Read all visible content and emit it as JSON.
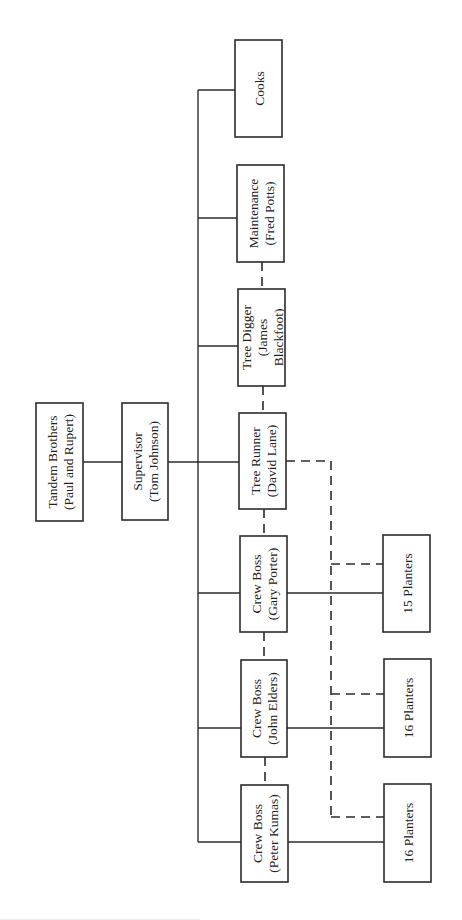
{
  "diagram": {
    "type": "org-chart",
    "orientation": "rotated-90-ccw",
    "line_color": "#2b2b2b",
    "nodes": [
      {
        "id": "tandem",
        "label_lines": [
          "Tandem Brothers",
          "(Paul and Rupert)"
        ],
        "x": 36,
        "y": 403,
        "w": 47,
        "h": 118
      },
      {
        "id": "supervisor",
        "label_lines": [
          "Supervisor",
          "(Tom Johnson)"
        ],
        "x": 122,
        "y": 403,
        "w": 46,
        "h": 117
      },
      {
        "id": "cooks",
        "label_lines": [
          "Cooks"
        ],
        "x": 235,
        "y": 40,
        "w": 47,
        "h": 97
      },
      {
        "id": "maintenance",
        "label_lines": [
          "Maintenance",
          "(Fred Potts)"
        ],
        "x": 237,
        "y": 165,
        "w": 47,
        "h": 97
      },
      {
        "id": "tree-digger",
        "label_lines": [
          "Tree Digger",
          "(James",
          "Blackfoot)"
        ],
        "x": 238,
        "y": 289,
        "w": 47,
        "h": 97
      },
      {
        "id": "tree-runner",
        "label_lines": [
          "Tree Runner",
          "(David Lane)"
        ],
        "x": 239,
        "y": 413,
        "w": 47,
        "h": 96
      },
      {
        "id": "crew-boss-gary",
        "label_lines": [
          "Crew Boss",
          "(Gary Porter)"
        ],
        "x": 240,
        "y": 536,
        "w": 47,
        "h": 96
      },
      {
        "id": "crew-boss-john",
        "label_lines": [
          "Crew Boss",
          "(John Elders)"
        ],
        "x": 241,
        "y": 660,
        "w": 46,
        "h": 97
      },
      {
        "id": "crew-boss-peter",
        "label_lines": [
          "Crew Boss",
          "(Peter Kumas)"
        ],
        "x": 241,
        "y": 785,
        "w": 47,
        "h": 97
      },
      {
        "id": "planters-15",
        "label_lines": [
          "15 Planters"
        ],
        "x": 383,
        "y": 535,
        "w": 47,
        "h": 97
      },
      {
        "id": "planters-16-a",
        "label_lines": [
          "16 Planters"
        ],
        "x": 384,
        "y": 659,
        "w": 47,
        "h": 98
      },
      {
        "id": "planters-16-b",
        "label_lines": [
          "16 Planters"
        ],
        "x": 384,
        "y": 784,
        "w": 47,
        "h": 98
      }
    ],
    "solid_lines": [
      {
        "from": "tandem",
        "to": "supervisor",
        "points": [
          [
            83,
            462
          ],
          [
            122,
            462
          ]
        ]
      },
      {
        "from": "supervisor",
        "to": "tree-runner",
        "points": [
          [
            168,
            462
          ],
          [
            239,
            462
          ]
        ]
      },
      {
        "name": "trunk",
        "points": [
          [
            198,
            90
          ],
          [
            198,
            842
          ]
        ]
      },
      {
        "to": "cooks",
        "points": [
          [
            198,
            90
          ],
          [
            235,
            90
          ]
        ]
      },
      {
        "to": "maintenance",
        "points": [
          [
            198,
            218
          ],
          [
            237,
            218
          ]
        ]
      },
      {
        "to": "tree-digger",
        "points": [
          [
            198,
            346
          ],
          [
            238,
            346
          ]
        ]
      },
      {
        "to": "crew-boss-gary",
        "points": [
          [
            198,
            593
          ],
          [
            240,
            593
          ]
        ]
      },
      {
        "to": "crew-boss-john",
        "points": [
          [
            198,
            728
          ],
          [
            241,
            728
          ]
        ]
      },
      {
        "to": "crew-boss-peter",
        "points": [
          [
            198,
            842
          ],
          [
            241,
            842
          ]
        ]
      },
      {
        "from": "crew-boss-gary",
        "to": "planters-15",
        "points": [
          [
            287,
            593
          ],
          [
            383,
            593
          ]
        ]
      },
      {
        "from": "crew-boss-john",
        "to": "planters-16-a",
        "points": [
          [
            287,
            728
          ],
          [
            384,
            728
          ]
        ]
      },
      {
        "from": "crew-boss-peter",
        "to": "planters-16-b",
        "points": [
          [
            288,
            842
          ],
          [
            384,
            842
          ]
        ]
      }
    ],
    "dashed_lines": [
      {
        "from": "maintenance",
        "to": "tree-digger",
        "points": [
          [
            262,
            262
          ],
          [
            262,
            289
          ]
        ]
      },
      {
        "from": "tree-digger",
        "to": "tree-runner",
        "points": [
          [
            263,
            386
          ],
          [
            263,
            413
          ]
        ]
      },
      {
        "from": "tree-runner",
        "to": "crew-boss-gary",
        "points": [
          [
            264,
            509
          ],
          [
            264,
            536
          ]
        ]
      },
      {
        "from": "crew-boss-gary",
        "to": "crew-boss-john",
        "points": [
          [
            264,
            632
          ],
          [
            264,
            660
          ]
        ]
      },
      {
        "from": "crew-boss-john",
        "to": "crew-boss-peter",
        "points": [
          [
            265,
            757
          ],
          [
            265,
            785
          ]
        ]
      },
      {
        "name": "tree-runner-supply",
        "points": [
          [
            286,
            461
          ],
          [
            331,
            461
          ],
          [
            331,
            817
          ]
        ]
      },
      {
        "to": "planters-15",
        "points": [
          [
            331,
            564
          ],
          [
            383,
            564
          ]
        ]
      },
      {
        "to": "planters-16-a",
        "points": [
          [
            331,
            694
          ],
          [
            384,
            694
          ]
        ]
      },
      {
        "to": "planters-16-b",
        "points": [
          [
            331,
            817
          ],
          [
            384,
            817
          ]
        ]
      }
    ]
  }
}
